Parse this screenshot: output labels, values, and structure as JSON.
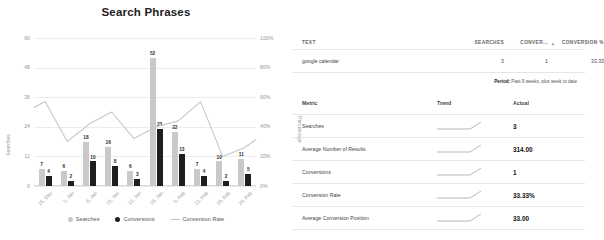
{
  "chart": {
    "title": "Search Phrases",
    "legend": [
      {
        "label": "Searches",
        "marker": "circle-light"
      },
      {
        "label": "Conversions",
        "marker": "circle-dark"
      },
      {
        "label": "Conversion Rate",
        "marker": "line"
      }
    ]
  },
  "chart_data": {
    "type": "bar",
    "title": "Search Phrases",
    "xlabel": "",
    "ylabel": "Searches",
    "y2label": "Percentage",
    "ylim": [
      0,
      60
    ],
    "y2lim": [
      0,
      100
    ],
    "yticks": [
      "0",
      "12",
      "24",
      "36",
      "48",
      "60"
    ],
    "y2ticks": [
      "0%",
      "20%",
      "40%",
      "60%",
      "80%",
      "100%"
    ],
    "grid": true,
    "legend_position": "bottom",
    "categories": [
      "25, Dec",
      "1, Jan",
      "8, Jan",
      "15, Jan",
      "22, Jan",
      "29, Jan",
      "5, Feb",
      "12, Feb",
      "19, Feb",
      "26, Feb"
    ],
    "series": [
      {
        "name": "Searches",
        "type": "bar",
        "color": "#c9c9c9",
        "values": [
          7,
          6,
          18,
          16,
          6,
          52,
          22,
          7,
          10,
          11
        ]
      },
      {
        "name": "Conversions",
        "type": "bar",
        "color": "#1e1e1e",
        "values": [
          4,
          2,
          10,
          8,
          3,
          23,
          13,
          4,
          2,
          5
        ]
      },
      {
        "name": "Conversion Rate",
        "type": "line",
        "axis": "y2",
        "color": "#c2c2c2",
        "values": [
          57,
          30,
          42,
          50,
          32,
          40,
          44,
          57,
          20,
          26
        ]
      }
    ]
  },
  "phrases_table": {
    "columns": [
      "TEXT",
      "SEARCHES",
      "CONVER...",
      "",
      "CONVERSION %"
    ],
    "sort_indicator": "▴",
    "rows": [
      {
        "text": "google calendar",
        "searches": "3",
        "conversions": "1",
        "rate": "33.33"
      }
    ]
  },
  "period": {
    "label": "Period:",
    "value": " Past 9 weeks, plus week to date"
  },
  "metrics_table": {
    "columns": [
      "Metric",
      "Trend",
      "Actual"
    ],
    "rows": [
      {
        "metric": "Searches",
        "actual": "3"
      },
      {
        "metric": "Average Number of Results",
        "actual": "314.00"
      },
      {
        "metric": "Conversions",
        "actual": "1"
      },
      {
        "metric": "Conversion Rate",
        "actual": "33.33%"
      },
      {
        "metric": "Average Conversion Position",
        "actual": "33.00"
      }
    ]
  }
}
